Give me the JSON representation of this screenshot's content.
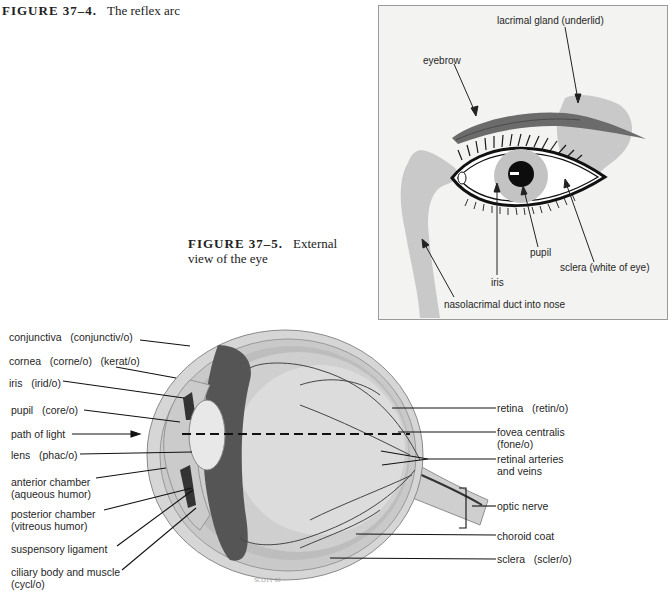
{
  "figures": {
    "fig_37_4": {
      "number": "FIGURE 37–4.",
      "title": "The reflex arc"
    },
    "fig_37_5": {
      "number": "FIGURE 37–5.",
      "title_line1": "External",
      "title_line2": "view of the eye"
    }
  },
  "external_eye": {
    "labels": {
      "lacrimal_gland": "lacrimal gland (underlid)",
      "eyebrow": "eyebrow",
      "pupil": "pupil",
      "iris": "iris",
      "sclera": "sclera (white of eye)",
      "nasolacrimal": "nasolacrimal duct into nose"
    },
    "colors": {
      "panel_bg": "#f3f3f1",
      "gray_structure": "#c7c7c7",
      "eyebrow": "#6a6a6a"
    }
  },
  "cross_section": {
    "left_labels": [
      {
        "line1": "conjunctiva   (conjunctiv/o)"
      },
      {
        "line1": "cornea   (corne/o)   (kerat/o)"
      },
      {
        "line1": "iris   (irid/o)"
      },
      {
        "line1": "pupil   (core/o)"
      },
      {
        "line1": "path of light"
      },
      {
        "line1": "lens   (phac/o)"
      },
      {
        "line1": "anterior chamber",
        "line2": "(aqueous humor)"
      },
      {
        "line1": "posterior chamber",
        "line2": "(vitreous humor)"
      },
      {
        "line1": "suspensory ligament"
      },
      {
        "line1": "ciliary body and muscle",
        "line2": "(cycl/o)"
      }
    ],
    "right_labels": [
      {
        "line1": "retina   (retin/o)"
      },
      {
        "line1": "fovea centralis",
        "line2": "(fone/o)"
      },
      {
        "line1": "retinal arteries",
        "line2": "and veins"
      },
      {
        "line1": "optic nerve"
      },
      {
        "line1": "choroid coat"
      },
      {
        "line1": "sclera   (scler/o)"
      }
    ]
  }
}
